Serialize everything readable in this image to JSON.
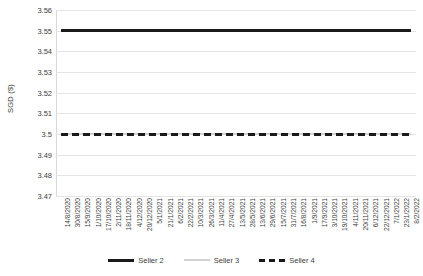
{
  "chart_data": {
    "type": "line",
    "title": "",
    "xlabel": "",
    "ylabel": "SGD ($)",
    "ylim": [
      3.47,
      3.56
    ],
    "y_ticks": [
      "3.47",
      "3.48",
      "3.49",
      "3.5",
      "3.51",
      "3.52",
      "3.53",
      "3.54",
      "3.55",
      "3.56"
    ],
    "grid": true,
    "legend_position": "bottom",
    "categories": [
      "14/8/2020",
      "30/8/2020",
      "15/9/2020",
      "1/10/2020",
      "17/10/2020",
      "2/11/2020",
      "18/11/2020",
      "4/12/2020",
      "20/12/2020",
      "5/1/2021",
      "21/1/2021",
      "6/2/2021",
      "22/2/2021",
      "10/3/2021",
      "26/3/2021",
      "11/4/2021",
      "27/4/2021",
      "13/5/2021",
      "28/5/2021",
      "13/6/2021",
      "29/6/2021",
      "15/7/2021",
      "31/7/2021",
      "16/8/2021",
      "1/9/2021",
      "17/9/2021",
      "3/10/2021",
      "19/10/2021",
      "4/11/2021",
      "20/11/2021",
      "6/12/2021",
      "22/12/2021",
      "7/1/2022",
      "23/1/2022",
      "8/2/2022"
    ],
    "series": [
      {
        "name": "Seller 2",
        "style": "solid-dark",
        "color": "#1a1a1a",
        "constant_value": 3.55,
        "values": [
          3.55,
          3.55,
          3.55,
          3.55,
          3.55,
          3.55,
          3.55,
          3.55,
          3.55,
          3.55,
          3.55,
          3.55,
          3.55,
          3.55,
          3.55,
          3.55,
          3.55,
          3.55,
          3.55,
          3.55,
          3.55,
          3.55,
          3.55,
          3.55,
          3.55,
          3.55,
          3.55,
          3.55,
          3.55,
          3.55,
          3.55,
          3.55,
          3.55,
          3.55,
          3.55
        ]
      },
      {
        "name": "Seller 3",
        "style": "solid-light",
        "color": "#d2d2d2",
        "constant_value": 3.5,
        "values": [
          3.5,
          3.5,
          3.5,
          3.5,
          3.5,
          3.5,
          3.5,
          3.5,
          3.5,
          3.5,
          3.5,
          3.5,
          3.5,
          3.5,
          3.5,
          3.5,
          3.5,
          3.5,
          3.5,
          3.5,
          3.5,
          3.5,
          3.5,
          3.5,
          3.5,
          3.5,
          3.5,
          3.5,
          3.5,
          3.5,
          3.5,
          3.5,
          3.5,
          3.5,
          3.5
        ]
      },
      {
        "name": "Seller 4",
        "style": "dashed-dark",
        "color": "#1a1a1a",
        "constant_value": 3.5,
        "values": [
          3.5,
          3.5,
          3.5,
          3.5,
          3.5,
          3.5,
          3.5,
          3.5,
          3.5,
          3.5,
          3.5,
          3.5,
          3.5,
          3.5,
          3.5,
          3.5,
          3.5,
          3.5,
          3.5,
          3.5,
          3.5,
          3.5,
          3.5,
          3.5,
          3.5,
          3.5,
          3.5,
          3.5,
          3.5,
          3.5,
          3.5,
          3.5,
          3.5,
          3.5,
          3.5
        ]
      }
    ]
  }
}
